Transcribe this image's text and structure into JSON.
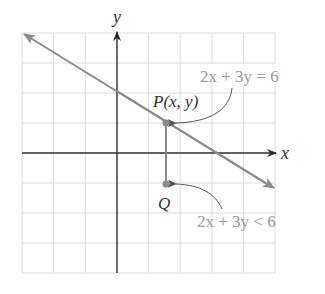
{
  "figure": {
    "axes": {
      "x_label": "x",
      "y_label": "y",
      "x_range": [
        -3,
        5
      ],
      "y_range": [
        -4,
        4
      ],
      "grid": true
    },
    "line": {
      "equation": "2x + 3y = 6",
      "label": "2x + 3y = 6"
    },
    "points": [
      {
        "name": "P",
        "label": "P(x, y)",
        "x": 1.5,
        "y": 1.0
      },
      {
        "name": "Q",
        "label": "Q",
        "x": 1.5,
        "y": -1.0
      }
    ],
    "region_label": "2x + 3y < 6",
    "colors": {
      "axes": "#2b2b2b",
      "grid": "#dcdcdc",
      "line": "#8a8a8a",
      "point": "#8a8a8a",
      "annotation_text": "#9a9a9a",
      "label_text": "#333333"
    }
  }
}
